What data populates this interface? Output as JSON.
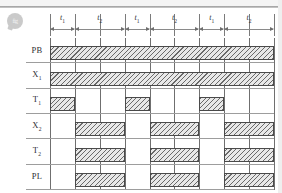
{
  "figure": {
    "type": "timing-diagram",
    "watermark_text": "fig"
  },
  "chart_data": {
    "type": "timing-diagram",
    "title": "",
    "xlabel": "",
    "ylabel": "",
    "grid": true,
    "legend": "none",
    "time_axis": {
      "intervals": [
        {
          "label": "t",
          "sub": "1",
          "start": 0,
          "end": 1
        },
        {
          "label": "t",
          "sub": "2",
          "start": 1,
          "end": 3
        },
        {
          "label": "t",
          "sub": "1",
          "start": 3,
          "end": 4
        },
        {
          "label": "t",
          "sub": "2",
          "start": 4,
          "end": 6
        },
        {
          "label": "t",
          "sub": "1",
          "start": 6,
          "end": 7
        },
        {
          "label": "t",
          "sub": "2",
          "start": 7,
          "end": 9
        }
      ],
      "gridline_positions": [
        0,
        1,
        2,
        3,
        4,
        5,
        6,
        7,
        8,
        9
      ],
      "range": [
        0,
        9
      ]
    },
    "signals": [
      {
        "name": "PB",
        "label": "PB",
        "sub": "",
        "pulses": [
          {
            "start": 0,
            "end": 9
          }
        ]
      },
      {
        "name": "X1",
        "label": "X",
        "sub": "1",
        "pulses": [
          {
            "start": 0,
            "end": 9
          }
        ]
      },
      {
        "name": "T1",
        "label": "T",
        "sub": "1",
        "pulses": [
          {
            "start": 0,
            "end": 1
          },
          {
            "start": 3,
            "end": 4
          },
          {
            "start": 6,
            "end": 7
          }
        ]
      },
      {
        "name": "X2",
        "label": "X",
        "sub": "2",
        "pulses": [
          {
            "start": 1,
            "end": 3
          },
          {
            "start": 4,
            "end": 6
          },
          {
            "start": 7,
            "end": 9
          }
        ]
      },
      {
        "name": "T2",
        "label": "T",
        "sub": "2",
        "pulses": [
          {
            "start": 1,
            "end": 3
          },
          {
            "start": 4,
            "end": 6
          },
          {
            "start": 7,
            "end": 9
          }
        ]
      },
      {
        "name": "PL",
        "label": "PL",
        "sub": "",
        "pulses": [
          {
            "start": 1,
            "end": 3
          },
          {
            "start": 4,
            "end": 6
          },
          {
            "start": 7,
            "end": 9
          }
        ]
      }
    ],
    "colors": {
      "pulse_fill": "#e8e8e8",
      "pulse_hatch": "#6a6a6a",
      "pulse_border": "#4a4a4a",
      "gridline": "#6f6f6f",
      "baseline": "#9d9d9d",
      "text": "#2e2e33",
      "background": "#ffffff"
    }
  }
}
